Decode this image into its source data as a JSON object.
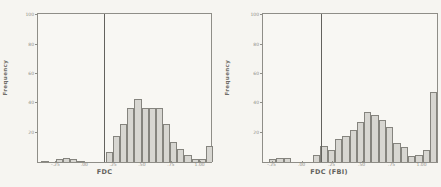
{
  "figure": {
    "description": "Two side-by-side scanned histograms",
    "background": "#f6f5f1"
  },
  "chart_data": [
    {
      "type": "bar",
      "variant": "histogram",
      "xlabel": "FDC",
      "ylabel": "Frequency",
      "x_tick_labels": [
        "-.25",
        ".00",
        ".25",
        ".50",
        ".75",
        "1.00"
      ],
      "x_tick_values": [
        -0.25,
        0,
        0.25,
        0.5,
        0.75,
        1.0
      ],
      "y_tick_labels": [
        "20",
        "40",
        "60",
        "80",
        "100"
      ],
      "y_tick_values": [
        20,
        40,
        60,
        80,
        100
      ],
      "xlim": [
        -0.41,
        1.09
      ],
      "ylim": [
        0,
        101
      ],
      "grid": false,
      "legend": "none",
      "ref_line_x": 0.16,
      "bin_start": -0.38,
      "bin_width": 0.062,
      "frequencies": [
        1,
        0,
        2,
        3,
        2,
        1,
        0,
        0,
        0,
        7,
        18,
        26,
        37,
        43,
        37,
        37,
        37,
        26,
        14,
        9,
        5,
        2,
        2,
        11
      ],
      "bar_fill": "#d7d6d1",
      "bar_border": "#85847e"
    },
    {
      "type": "bar",
      "variant": "histogram",
      "xlabel": "FDC (FBI)",
      "ylabel": "Frequency",
      "x_tick_labels": [
        "-.25",
        ".00",
        ".25",
        ".50",
        ".75",
        "1.00"
      ],
      "x_tick_values": [
        -0.25,
        0,
        0.25,
        0.5,
        0.75,
        1.0
      ],
      "y_tick_labels": [
        "20",
        "40",
        "60",
        "80",
        "100"
      ],
      "y_tick_values": [
        20,
        40,
        60,
        80,
        100
      ],
      "xlim": [
        -0.33,
        1.12
      ],
      "ylim": [
        0,
        101
      ],
      "grid": false,
      "legend": "none",
      "ref_line_x": 0.15,
      "bin_start": -0.28,
      "bin_width": 0.061,
      "frequencies": [
        2,
        3,
        3,
        0,
        0,
        0,
        5,
        11,
        8,
        16,
        18,
        22,
        27,
        34,
        32,
        29,
        24,
        13,
        10,
        4,
        5,
        8,
        48
      ],
      "bar_fill": "#d7d6d1",
      "bar_border": "#85847e"
    }
  ]
}
